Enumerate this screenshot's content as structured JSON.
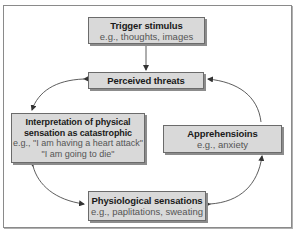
{
  "diagram": {
    "type": "flowchart-cycle",
    "nodes": [
      {
        "id": "trigger",
        "title": "Trigger stimulus",
        "lines": [
          "e.g., thoughts, images"
        ]
      },
      {
        "id": "perceived",
        "title": "Perceived threats",
        "lines": []
      },
      {
        "id": "interpretation",
        "title_lines": [
          "Interpretation of physical",
          "sensation as catastrophic"
        ],
        "lines": [
          "e.g., \"I am having a heart attack\"",
          "\"I am going to die\""
        ]
      },
      {
        "id": "apprehensions",
        "title": "Apprehensioins",
        "lines": [
          "e.g., anxiety"
        ]
      },
      {
        "id": "physiological",
        "title": "Physiological sensations",
        "lines": [
          "e.g., paplitations, sweating"
        ]
      }
    ],
    "edges": [
      {
        "from": "trigger",
        "to": "perceived",
        "style": "straight"
      },
      {
        "from": "perceived",
        "to": "interpretation",
        "style": "curved",
        "bidirectional": true
      },
      {
        "from": "apprehensions",
        "to": "perceived",
        "style": "curved"
      },
      {
        "from": "interpretation",
        "to": "physiological",
        "style": "curved",
        "bidirectional": true
      },
      {
        "from": "physiological",
        "to": "apprehensions",
        "style": "curved",
        "bidirectional": true
      }
    ],
    "colors": {
      "box_fill": "#d9d9d9",
      "box_border": "#6b6b6b",
      "shadow": "#8c8c8c",
      "arrow": "#333333",
      "frame": "#8a8a8a"
    }
  }
}
